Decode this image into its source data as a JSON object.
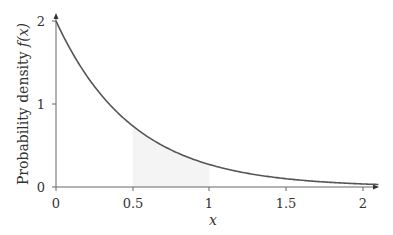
{
  "chart_data": {
    "type": "line",
    "title": "",
    "xlabel": "x",
    "ylabel": "Probability density f(x)",
    "xlim": [
      0,
      2.1
    ],
    "ylim": [
      0,
      2
    ],
    "grid": false,
    "x_ticks": [
      "0",
      "0.5",
      "1",
      "1.5",
      "2"
    ],
    "y_ticks": [
      "0",
      "1",
      "2"
    ],
    "series": [
      {
        "name": "f(x) = 2e^(-2x)",
        "color": "#555555",
        "x": [
          0,
          0.1,
          0.2,
          0.3,
          0.4,
          0.5,
          0.6,
          0.7,
          0.8,
          0.9,
          1.0,
          1.1,
          1.2,
          1.3,
          1.4,
          1.5,
          1.6,
          1.7,
          1.8,
          1.9,
          2.0,
          2.1
        ],
        "y": [
          2.0,
          1.637,
          1.341,
          1.098,
          0.899,
          0.736,
          0.602,
          0.493,
          0.404,
          0.331,
          0.271,
          0.222,
          0.181,
          0.149,
          0.122,
          0.1,
          0.082,
          0.067,
          0.055,
          0.045,
          0.037,
          0.03
        ]
      }
    ],
    "shaded_region": {
      "x_from": 0.5,
      "x_to": 1.0,
      "color": "#f4f4f4"
    }
  },
  "labels": {
    "ylabel_text": "Probability density ",
    "ylabel_fx": "f(x)",
    "xlabel": "x",
    "x_ticks": [
      "0",
      "0.5",
      "1",
      "1.5",
      "2"
    ],
    "y_ticks": [
      "0",
      "1",
      "2"
    ]
  }
}
